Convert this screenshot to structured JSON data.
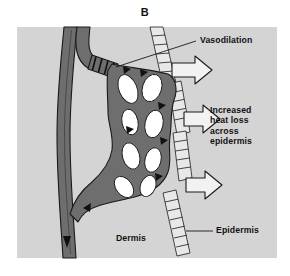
{
  "figure": {
    "panel_label": "B",
    "labels": {
      "vasodilation": "Vasodilation",
      "heat_loss": "Increased\nheat loss\nacross\nepidermis",
      "dermis": "Dermis",
      "epidermis": "Epidermis"
    },
    "colors": {
      "page_background": "#ffffff",
      "panel_background": "#d4d4d4",
      "vessel_fill": "#6e6e6e",
      "vessel_outline": "#1a1a1a",
      "lumen_void": "#ffffff",
      "arrow_fill": "#f2f2f2",
      "arrow_outline": "#1a1a1a",
      "epidermis_fill": "#e8e8e8",
      "epidermis_outline": "#1a1a1a",
      "text": "#111111",
      "leader_line": "#1a1a1a"
    },
    "elements": {
      "arteriole": "descending arteriole carrying blood into the dermal plexus",
      "sphincter": "dilated precapillary sphincter shown as banded constriction ring",
      "capillary_plexus": "dense network of dilated capillary loops with white lumen voids",
      "venule": "ascending venule returning blood downward out of the field",
      "epidermis_band": "hatched ladder-like band representing the epidermis at the skin surface",
      "heat_arrows": "three hollow outlined arrows directed outward through the epidermis"
    },
    "flow_arrow_count": 8,
    "heat_arrow_count": 3,
    "epidermis_segment_count": 4
  }
}
